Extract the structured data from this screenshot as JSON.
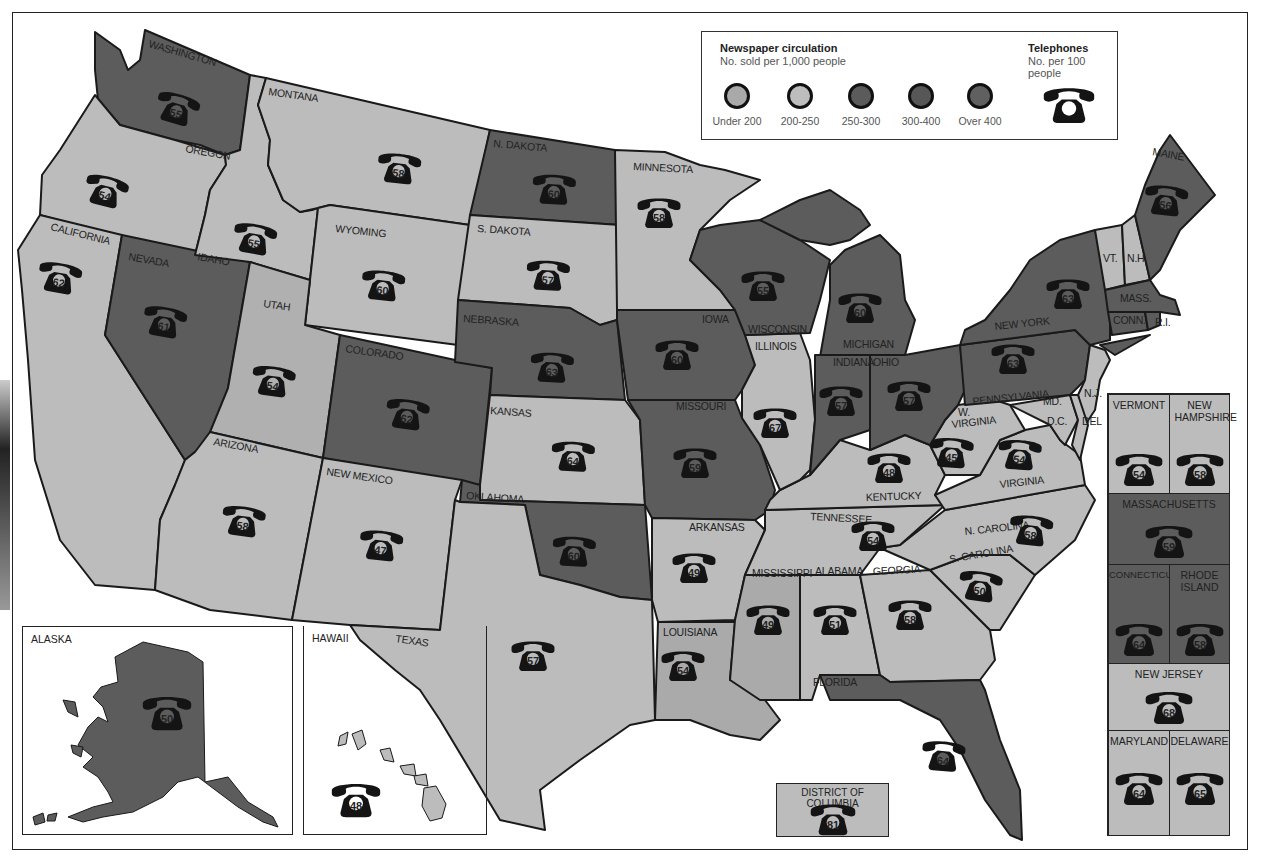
{
  "legend": {
    "newspaper_title": "Newspaper circulation",
    "newspaper_sub": "No. sold per 1,000 people",
    "telephone_title": "Telephones",
    "telephone_sub": "No. per 100 people",
    "categories": [
      {
        "label": "Under 200",
        "color": "#a9a9a9"
      },
      {
        "label": "200-250",
        "color": "#bdbdbd"
      },
      {
        "label": "250-300",
        "color": "#5b5b5b"
      },
      {
        "label": "300-400",
        "color": "#575757"
      },
      {
        "label": "Over 400",
        "color": "#606060"
      }
    ],
    "telephone_icon": "telephone-icon"
  },
  "colors": {
    "light": "#bcbcbc",
    "mid": "#aaaaaa",
    "dark": "#5c5c5c",
    "phone": "#141414",
    "border": "#1a1a1a"
  },
  "states": {
    "washington": {
      "label": "WASHINGTON",
      "phones": "55"
    },
    "oregon": {
      "label": "OREGON",
      "phones": "54"
    },
    "california": {
      "label": "CALIFORNIA",
      "phones": "62"
    },
    "idaho": {
      "label": "IDAHO",
      "phones": "55"
    },
    "nevada": {
      "label": "NEVADA",
      "phones": "61"
    },
    "montana": {
      "label": "MONTANA",
      "phones": "58"
    },
    "wyoming": {
      "label": "WYOMING",
      "phones": "60"
    },
    "utah": {
      "label": "UTAH",
      "phones": "54"
    },
    "colorado": {
      "label": "COLORADO",
      "phones": "62"
    },
    "arizona": {
      "label": "ARIZONA",
      "phones": "58"
    },
    "new_mexico": {
      "label": "NEW MEXICO",
      "phones": "47"
    },
    "n_dakota": {
      "label": "N. DAKOTA",
      "phones": "60"
    },
    "s_dakota": {
      "label": "S. DAKOTA",
      "phones": "57"
    },
    "nebraska": {
      "label": "NEBRASKA",
      "phones": "63"
    },
    "kansas": {
      "label": "KANSAS",
      "phones": "64"
    },
    "oklahoma": {
      "label": "OKLAHOMA",
      "phones": "60"
    },
    "texas": {
      "label": "TEXAS",
      "phones": "57"
    },
    "minnesota": {
      "label": "MINNESOTA",
      "phones": "58"
    },
    "iowa": {
      "label": "IOWA",
      "phones": "60"
    },
    "missouri": {
      "label": "MISSOURI",
      "phones": "59"
    },
    "arkansas": {
      "label": "ARKANSAS",
      "phones": "49"
    },
    "louisiana": {
      "label": "LOUISIANA",
      "phones": "54"
    },
    "wisconsin": {
      "label": "WISCONSIN",
      "phones": "55"
    },
    "illinois": {
      "label": "ILLINOIS",
      "phones": "67"
    },
    "michigan": {
      "label": "MICHIGAN",
      "phones": "60"
    },
    "indiana": {
      "label": "INDIANA",
      "phones": "57"
    },
    "ohio": {
      "label": "OHIO",
      "phones": "57"
    },
    "kentucky": {
      "label": "KENTUCKY",
      "phones": "48"
    },
    "tennessee": {
      "label": "TENNESSEE",
      "phones": "54"
    },
    "mississippi": {
      "label": "MISSISSIPPI",
      "phones": "49"
    },
    "alabama": {
      "label": "ALABAMA",
      "phones": "51"
    },
    "georgia": {
      "label": "GEORGIA",
      "phones": "58"
    },
    "florida": {
      "label": "FLORIDA",
      "phones": "64"
    },
    "s_carolina": {
      "label": "S. CAROLINA",
      "phones": "50"
    },
    "n_carolina": {
      "label": "N. CAROLINA",
      "phones": "58"
    },
    "virginia": {
      "label": "VIRGINIA",
      "phones": "54"
    },
    "w_virginia": {
      "label_1": "W.",
      "label_2": "VIRGINIA",
      "phones": "45"
    },
    "pennsylvania": {
      "label": "PENNSYLVANIA",
      "phones": "63"
    },
    "new_york": {
      "label": "NEW YORK",
      "phones": "63"
    },
    "maine": {
      "label": "MAINE",
      "phones": "56"
    },
    "vt": {
      "label": "VT."
    },
    "nh": {
      "label": "N.H."
    },
    "mass": {
      "label": "MASS."
    },
    "conn": {
      "label": "CONN."
    },
    "ri": {
      "label": "R.I."
    },
    "nj": {
      "label": "N.J."
    },
    "del": {
      "label": "DEL"
    },
    "md": {
      "label": "MD."
    },
    "dc": {
      "label": "D.C."
    }
  },
  "insets": {
    "alaska": {
      "label": "ALASKA",
      "phones": "50"
    },
    "hawaii": {
      "label": "HAWAII",
      "phones": "48"
    },
    "dc": {
      "label": "DISTRICT OF COLUMBIA",
      "phones": "81"
    }
  },
  "northeast_panel": [
    {
      "label": "VERMONT",
      "phones": "54"
    },
    {
      "label": "NEW HAMPSHIRE",
      "phones": "58"
    },
    {
      "label": "MASSACHUSETTS",
      "phones": "59"
    },
    {
      "label": "CONNECTICUT",
      "phones": "64"
    },
    {
      "label": "RHODE ISLAND",
      "phones": "58"
    },
    {
      "label": "NEW JERSEY",
      "phones": "68"
    },
    {
      "label": "MARYLAND",
      "phones": "64"
    },
    {
      "label": "DELAWARE",
      "phones": "65"
    }
  ]
}
